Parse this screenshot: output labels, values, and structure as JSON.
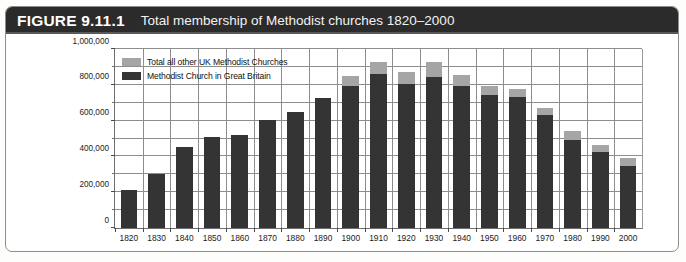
{
  "figure": {
    "label": "FIGURE 9.11.1",
    "title": "Total membership of Methodist churches 1820–2000",
    "banner_color": "#2b2b2b"
  },
  "legend": {
    "position": "inside-top-left",
    "items": [
      {
        "label": "Total all other UK Methodist Churches",
        "color": "#a5a5a5"
      },
      {
        "label": "Methodist Church in Great Britain",
        "color": "#343434"
      }
    ]
  },
  "chart_data": {
    "type": "bar",
    "title": "Total membership of Methodist churches 1820–2000",
    "xlabel": "",
    "ylabel": "",
    "ylim": [
      0,
      1000000
    ],
    "grid": true,
    "stacked": true,
    "legend_position": "inside-top-left",
    "categories": [
      "1820",
      "1830",
      "1840",
      "1850",
      "1860",
      "1870",
      "1880",
      "1890",
      "1900",
      "1910",
      "1920",
      "1930",
      "1940",
      "1950",
      "1960",
      "1970",
      "1980",
      "1990",
      "2000"
    ],
    "ytick_labels": [
      "0",
      "200,000",
      "400,000",
      "600,000",
      "800,000",
      "1,000,000"
    ],
    "ytick_values": [
      0,
      200000,
      400000,
      600000,
      800000,
      1000000
    ],
    "yminor_values": [
      100000,
      300000,
      500000,
      700000,
      900000
    ],
    "series": [
      {
        "name": "Methodist Church in Great Britain",
        "color": "#343434",
        "values": [
          215000,
          300000,
          450000,
          510000,
          520000,
          605000,
          650000,
          725000,
          795000,
          860000,
          805000,
          845000,
          795000,
          745000,
          730000,
          630000,
          490000,
          425000,
          345000
        ]
      },
      {
        "name": "Total all other UK Methodist Churches",
        "color": "#a5a5a5",
        "values": [
          0,
          0,
          0,
          0,
          0,
          0,
          0,
          0,
          55000,
          65000,
          65000,
          80000,
          60000,
          50000,
          45000,
          40000,
          50000,
          40000,
          45000
        ]
      }
    ],
    "totals": [
      215000,
      300000,
      450000,
      510000,
      520000,
      605000,
      650000,
      725000,
      850000,
      925000,
      870000,
      925000,
      855000,
      795000,
      775000,
      670000,
      540000,
      465000,
      390000
    ]
  }
}
